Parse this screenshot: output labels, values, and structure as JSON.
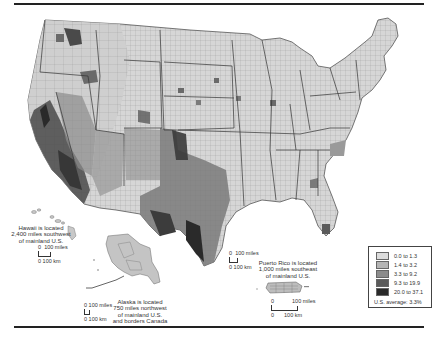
{
  "map": {
    "subject": "County-level choropleth of the United States",
    "insets": {
      "hawaii": {
        "note": [
          "Hawaii is located",
          "2,400 miles southwest",
          "of mainland U.S."
        ],
        "scale": {
          "miles": "100 miles",
          "km": "100 km",
          "zero": "0"
        }
      },
      "alaska": {
        "note": [
          "Alaska is located",
          "750 miles northwest",
          "of mainland U.S.",
          "and borders Canada"
        ],
        "scale": {
          "miles": "100 miles",
          "km": "100 km",
          "zero": "0"
        }
      },
      "puerto_rico": {
        "note": [
          "Puerto Rico is located",
          "1,000 miles southeast",
          "of mainland U.S."
        ],
        "scale": {
          "miles": "100 miles",
          "km": "100 km",
          "zero": "0"
        }
      },
      "mainland": {
        "scale": {
          "miles": "100 miles",
          "km": "100 km",
          "zero": "0"
        }
      }
    },
    "legend": {
      "classes": [
        {
          "label": "0.0 to 1.3",
          "color": "#dcdcdc"
        },
        {
          "label": "1.4 to 3.2",
          "color": "#b4b4b4"
        },
        {
          "label": "3.3 to 9.2",
          "color": "#8c8c8c"
        },
        {
          "label": "9.3 to 19.9",
          "color": "#5a5a5a"
        },
        {
          "label": "20.0 to 37.1",
          "color": "#2a2a2a"
        }
      ],
      "average": "U.S. average: 3.3%"
    }
  }
}
